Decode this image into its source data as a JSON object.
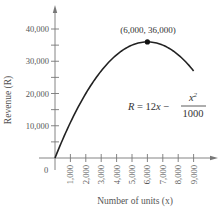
{
  "chart_data": {
    "type": "line",
    "title": "",
    "xlabel": "Number of units (x)",
    "ylabel": "Revenue (R)",
    "xlim": [
      0,
      9800
    ],
    "ylim": [
      0,
      42000
    ],
    "grid": false,
    "legend": null,
    "x_ticks": [
      1000,
      2000,
      3000,
      4000,
      5000,
      6000,
      7000,
      8000,
      9000
    ],
    "x_tick_labels": [
      "1,000",
      "2,000",
      "3,000",
      "4,000",
      "5,000",
      "6,000",
      "7,000",
      "8,000",
      "9,000"
    ],
    "y_ticks": [
      10000,
      20000,
      30000,
      40000
    ],
    "y_tick_labels": [
      "10,000",
      "20,000",
      "30,000",
      "40,000"
    ],
    "y_minor_ticks": [
      5000,
      15000,
      25000,
      35000
    ],
    "origin_label": "0",
    "series": [
      {
        "name": "R = 12x - x^2/1000",
        "x": [
          0,
          1000,
          2000,
          3000,
          4000,
          5000,
          6000,
          7000,
          8000,
          9000
        ],
        "values": [
          0,
          11000,
          20000,
          27000,
          32000,
          35000,
          36000,
          35000,
          32000,
          27000
        ]
      }
    ],
    "annotations": [
      {
        "type": "point",
        "x": 6000,
        "y": 36000,
        "label": "(6,000, 36,000)"
      },
      {
        "type": "equation",
        "text": "R = 12x − x²/1000"
      }
    ]
  },
  "labels": {
    "x_axis_title": "Number of units",
    "x_axis_var": "(x)",
    "y_axis_title": "Revenue",
    "y_axis_var": "(R)",
    "peak_label": "(6,000, 36,000)",
    "origin": "0",
    "formula_lhs": "R",
    "formula_eq": " = 12",
    "formula_x": "x",
    "formula_minus": " − ",
    "formula_num": "x",
    "formula_num_exp": "2",
    "formula_den": "1000"
  },
  "colors": {
    "axis": "#777777",
    "curve": "#222222",
    "text": "#555555"
  }
}
